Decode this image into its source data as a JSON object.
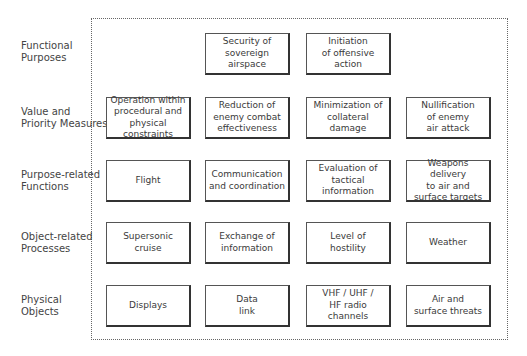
{
  "levels": [
    {
      "label": "Functional\nPurposes"
    },
    {
      "label": "Value and\nPriority Measures"
    },
    {
      "label": "Purpose-related\nFunctions"
    },
    {
      "label": "Object-related\nProcesses"
    },
    {
      "label": "Physical\nObjects"
    }
  ],
  "nodes": {
    "functional_purposes": [
      "",
      "Security of\nsovereign\nairspace",
      "Initiation\nof offensive\naction",
      ""
    ],
    "value_priority": [
      "Operation within\nprocedural and\nphysical constraints",
      "Reduction of\nenemy combat\neffectiveness",
      "Minimization of\ncollateral\ndamage",
      "Nullification\nof enemy\nair attack"
    ],
    "purpose_functions": [
      "Flight",
      "Communication\nand coordination",
      "Evaluation of\ntactical\ninformation",
      "Weapons delivery\nto air and\nsurface targets"
    ],
    "object_processes": [
      "Supersonic\ncruise",
      "Exchange of\ninformation",
      "Level of\nhostility",
      "Weather"
    ],
    "physical_objects": [
      "Displays",
      "Data\nlink",
      "VHF / UHF /\nHF radio\nchannels",
      "Air and\nsurface threats"
    ]
  }
}
